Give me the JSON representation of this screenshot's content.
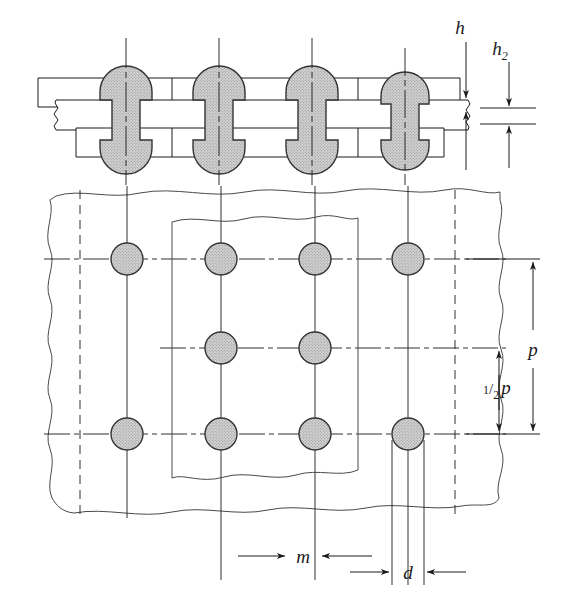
{
  "drawing": {
    "title": "Riveted butt joint with cover plates",
    "view_top": "elevation-section",
    "view_bottom": "plan-view",
    "background_color": "#ffffff",
    "line_color": "#1a1a1a",
    "thin_line_color": "#4a4a4a",
    "hatch_fill": "#c8c8c8",
    "rivet_outline": "#333333"
  },
  "dimensions": [
    {
      "id": "h",
      "label": "h",
      "subscript": "",
      "orientation": "vertical",
      "description": "cover plate thickness"
    },
    {
      "id": "h2",
      "label": "h",
      "subscript": "2",
      "orientation": "vertical",
      "description": "main plate thickness"
    },
    {
      "id": "p",
      "label": "p",
      "subscript": "",
      "orientation": "vertical",
      "description": "rivet pitch"
    },
    {
      "id": "half_p",
      "label": "p",
      "numerator": "1",
      "denominator": "2",
      "orientation": "vertical",
      "description": "half pitch"
    },
    {
      "id": "m",
      "label": "m",
      "subscript": "",
      "orientation": "horizontal",
      "description": "edge / row spacing"
    },
    {
      "id": "d",
      "label": "d",
      "subscript": "",
      "orientation": "horizontal",
      "description": "rivet diameter"
    }
  ],
  "rivets": {
    "elevation_centers_x": [
      126,
      219,
      312,
      405
    ],
    "elevation_axis_top": 38,
    "elevation_axis_bottom": 185,
    "shank_half_width": 14,
    "head_radius": 26,
    "plan_rows": [
      {
        "row": 1,
        "y": 259,
        "centers_x": [
          127,
          221,
          315,
          408
        ]
      },
      {
        "row": 2,
        "y": 348,
        "centers_x": [
          221,
          315
        ]
      },
      {
        "row": 3,
        "y": 434,
        "centers_x": [
          127,
          221,
          315,
          408
        ]
      }
    ],
    "plan_radius": 16
  },
  "plates": {
    "upper_cover": {
      "top_y": 78,
      "bottom_y": 107
    },
    "main_plate": {
      "top_y": 100,
      "bottom_y": 130
    },
    "lower_cover": {
      "top_y": 128,
      "bottom_y": 157
    }
  }
}
